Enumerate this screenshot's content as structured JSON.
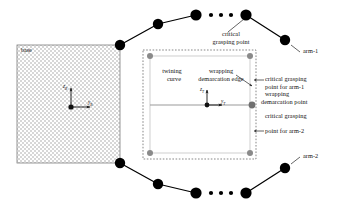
{
  "figure": {
    "base_block": {
      "label": "base"
    },
    "frames": {
      "base_frame": {
        "z_axis": "z",
        "z_sub": "B",
        "y_axis": "y",
        "y_sub": "B"
      },
      "tool_frame": {
        "z_axis": "z",
        "z_sub": "T",
        "y_axis": "y",
        "y_sub": "T"
      }
    },
    "labels": {
      "critical_grasping_point": "critical\ngrasping point",
      "critical_grasping_point_line1": "critical",
      "critical_grasping_point_line2": "grasping point",
      "twining_curve_line1": "twining",
      "twining_curve_line2": "curve",
      "wrapping_demarcation_edge_line1": "wrapping",
      "wrapping_demarcation_edge_line2": "demarcation edge",
      "critical_grasping_point_arm1_line1": "critical grasping",
      "critical_grasping_point_arm1_line2": "point for arm-1",
      "wrapping_demarcation_point_line1": "wrapping",
      "wrapping_demarcation_point_line2": "demarcation point",
      "critical_grasping_point_arm2_line1": "critical grasping",
      "critical_grasping_point_arm2_line2": "point for arm-2",
      "arm_1": "arm-1",
      "arm_2": "arm-2"
    },
    "colors": {
      "joint_fill": "#000000",
      "link_line": "#000000",
      "hatch_fill": "#d8d8d8",
      "dashed_border": "#555555",
      "inner_rect": "#c9c9c9",
      "gray_marker": "#8a8a8a",
      "center_line": "#9a9a9a",
      "text": "#111111"
    },
    "geometry": {
      "joints_arm1": [
        {
          "cx": 120,
          "cy": 45,
          "r": 5.2
        },
        {
          "cx": 158,
          "cy": 24,
          "r": 5.2
        },
        {
          "cx": 196,
          "cy": 15,
          "r": 5.6
        },
        {
          "cx": 246,
          "cy": 15,
          "r": 5.6
        },
        {
          "cx": 285,
          "cy": 40,
          "r": 5.2
        }
      ],
      "joints_arm2": [
        {
          "cx": 120,
          "cy": 163,
          "r": 5.2
        },
        {
          "cx": 158,
          "cy": 184,
          "r": 5.2
        },
        {
          "cx": 196,
          "cy": 193,
          "r": 5.6
        },
        {
          "cx": 246,
          "cy": 193,
          "r": 5.6
        },
        {
          "cx": 285,
          "cy": 168,
          "r": 5.2
        }
      ],
      "ellipsis_top": [
        {
          "cx": 211,
          "cy": 15,
          "r": 2.1
        },
        {
          "cx": 221,
          "cy": 15,
          "r": 2.1
        },
        {
          "cx": 231,
          "cy": 15,
          "r": 2.1
        }
      ],
      "ellipsis_bottom": [
        {
          "cx": 211,
          "cy": 193,
          "r": 2.1
        },
        {
          "cx": 221,
          "cy": 193,
          "r": 2.1
        },
        {
          "cx": 231,
          "cy": 193,
          "r": 2.1
        }
      ],
      "dashed_rect": {
        "x": 143,
        "y": 50,
        "w": 113,
        "h": 109
      },
      "inner_rect": {
        "x": 150,
        "y": 56,
        "w": 100,
        "h": 97
      },
      "corner_markers": [
        {
          "cx": 150,
          "cy": 56,
          "r": 3.0
        },
        {
          "cx": 250,
          "cy": 56,
          "r": 3.0
        },
        {
          "cx": 150,
          "cy": 153,
          "r": 3.0
        },
        {
          "cx": 250,
          "cy": 153,
          "r": 3.0
        }
      ],
      "demarcation_marker": {
        "cx": 252,
        "cy": 105,
        "r": 3.4
      },
      "center_origin": {
        "cx": 207,
        "cy": 105,
        "r": 2.4
      },
      "base_block": {
        "x": 17,
        "y": 45,
        "w": 103,
        "h": 118
      }
    }
  }
}
